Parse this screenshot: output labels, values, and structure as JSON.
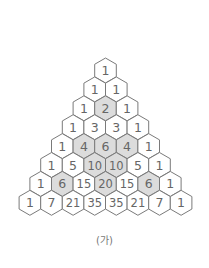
{
  "figure": {
    "caption": "(가)",
    "colors": {
      "stroke": "#7a7a7a",
      "fill": "#ffffff",
      "shaded_fill": "#dcdcdc",
      "text": "#666666"
    },
    "rows": [
      [
        {
          "v": "1",
          "s": false
        }
      ],
      [
        {
          "v": "1",
          "s": false
        },
        {
          "v": "1",
          "s": false
        }
      ],
      [
        {
          "v": "1",
          "s": false
        },
        {
          "v": "2",
          "s": true
        },
        {
          "v": "1",
          "s": false
        }
      ],
      [
        {
          "v": "1",
          "s": false
        },
        {
          "v": "3",
          "s": false
        },
        {
          "v": "3",
          "s": false
        },
        {
          "v": "1",
          "s": false
        }
      ],
      [
        {
          "v": "1",
          "s": false
        },
        {
          "v": "4",
          "s": true
        },
        {
          "v": "6",
          "s": true
        },
        {
          "v": "4",
          "s": true
        },
        {
          "v": "1",
          "s": false
        }
      ],
      [
        {
          "v": "1",
          "s": false
        },
        {
          "v": "5",
          "s": false
        },
        {
          "v": "10",
          "s": true
        },
        {
          "v": "10",
          "s": true
        },
        {
          "v": "5",
          "s": false
        },
        {
          "v": "1",
          "s": false
        }
      ],
      [
        {
          "v": "1",
          "s": false
        },
        {
          "v": "6",
          "s": true
        },
        {
          "v": "15",
          "s": false
        },
        {
          "v": "20",
          "s": true
        },
        {
          "v": "15",
          "s": false
        },
        {
          "v": "6",
          "s": true
        },
        {
          "v": "1",
          "s": false
        }
      ],
      [
        {
          "v": "1",
          "s": false
        },
        {
          "v": "7",
          "s": false
        },
        {
          "v": "21",
          "s": false
        },
        {
          "v": "35",
          "s": false
        },
        {
          "v": "35",
          "s": false
        },
        {
          "v": "21",
          "s": false
        },
        {
          "v": "7",
          "s": false
        },
        {
          "v": "1",
          "s": false
        }
      ]
    ]
  }
}
